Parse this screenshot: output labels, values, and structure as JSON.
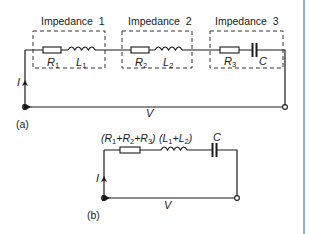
{
  "diagram": {
    "part_a": {
      "label": "(a)",
      "impedances": [
        {
          "title": "Impedance  1",
          "resistor": "R",
          "resistor_sub": "1",
          "element2": "L",
          "element2_sub": "1",
          "element2_type": "inductor"
        },
        {
          "title": "Impedance  2",
          "resistor": "R",
          "resistor_sub": "2",
          "element2": "L",
          "element2_sub": "2",
          "element2_type": "inductor"
        },
        {
          "title": "Impedance  3",
          "resistor": "R",
          "resistor_sub": "3",
          "element2": "C",
          "element2_sub": "",
          "element2_type": "capacitor"
        }
      ],
      "current_label": "I",
      "voltage_label": "V"
    },
    "part_b": {
      "label": "(b)",
      "resistor_label_parts": [
        "(R",
        "1",
        "+R",
        "2",
        "+R",
        "3",
        ")"
      ],
      "inductor_label_parts": [
        "(L",
        "1",
        "+L",
        "2",
        ")"
      ],
      "capacitor_label": "C",
      "current_label": "I",
      "voltage_label": "V"
    },
    "colors": {
      "line": "#1a1a1a",
      "dash": "#333333",
      "edge": "#8fb3c9"
    }
  }
}
